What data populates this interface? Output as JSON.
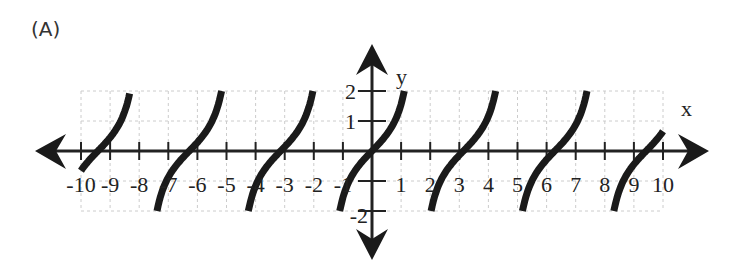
{
  "panel": {
    "label": "(A)"
  },
  "chart_data": {
    "type": "line",
    "title": "",
    "function_shape": "tangent-like periodic branches, period ≈ π, clipped to -2 ≤ y ≤ 2",
    "xlabel": "x",
    "ylabel": "y",
    "xlim": [
      -10,
      10
    ],
    "ylim": [
      -2,
      2
    ],
    "grid": true,
    "x_ticks": [
      -10,
      -9,
      -8,
      -7,
      -6,
      -5,
      -4,
      -3,
      -2,
      -1,
      1,
      2,
      3,
      4,
      5,
      6,
      7,
      8,
      9,
      10
    ],
    "x_tick_labels": [
      "-10",
      "-9",
      "-8",
      "-7",
      "-6",
      "-5",
      "-4",
      "-3",
      "-2",
      "-1",
      "1",
      "2",
      "3",
      "4",
      "5",
      "6",
      "7",
      "8",
      "9",
      "10"
    ],
    "y_ticks": [
      -2,
      -1,
      1,
      2
    ],
    "y_tick_labels": [
      "-2",
      "-1",
      "1",
      "2"
    ],
    "series": [
      {
        "name": "branch-1",
        "zero": -9.42,
        "x_range": [
          -10,
          -8.33
        ]
      },
      {
        "name": "branch-2",
        "zero": -6.28,
        "x_range": [
          -7.39,
          -5.17
        ]
      },
      {
        "name": "branch-3",
        "zero": -3.14,
        "x_range": [
          -4.25,
          -2.03
        ]
      },
      {
        "name": "branch-4",
        "zero": 0.0,
        "x_range": [
          -1.11,
          1.11
        ]
      },
      {
        "name": "branch-5",
        "zero": 3.14,
        "x_range": [
          2.03,
          4.25
        ]
      },
      {
        "name": "branch-6",
        "zero": 6.28,
        "x_range": [
          5.17,
          7.39
        ]
      },
      {
        "name": "branch-7",
        "zero": 9.42,
        "x_range": [
          8.31,
          10
        ]
      }
    ],
    "colors": {
      "curve": "#1a1a1a",
      "axis": "#222222",
      "grid": "#cccccc"
    }
  }
}
